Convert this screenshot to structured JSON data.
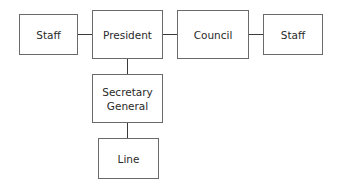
{
  "diagram": {
    "type": "organization-chart",
    "nodes": [
      {
        "id": "staff-left",
        "label": "Staff"
      },
      {
        "id": "president",
        "label": "President"
      },
      {
        "id": "council",
        "label": "Council"
      },
      {
        "id": "staff-right",
        "label": "Staff"
      },
      {
        "id": "secretary-general",
        "label": "Secretary General",
        "lines": [
          "Secretary",
          "General"
        ]
      },
      {
        "id": "line",
        "label": "Line"
      }
    ],
    "edges": [
      {
        "from": "staff-left",
        "to": "president"
      },
      {
        "from": "president",
        "to": "council"
      },
      {
        "from": "council",
        "to": "staff-right"
      },
      {
        "from": "president",
        "to": "secretary-general"
      },
      {
        "from": "secretary-general",
        "to": "line"
      }
    ]
  }
}
